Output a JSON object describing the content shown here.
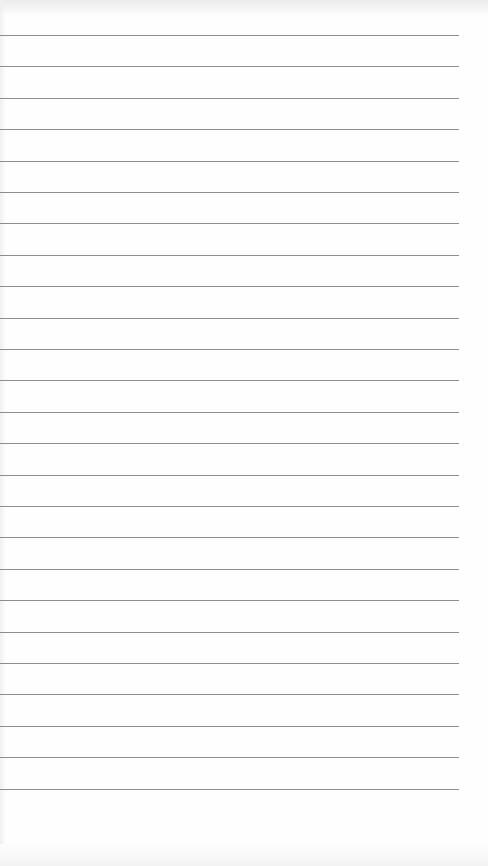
{
  "page": {
    "type": "lined-notepad",
    "line_count": 25,
    "first_line_y": 35,
    "line_spacing": 31.4,
    "line_width": 459,
    "line_color": "#8e8e8e",
    "paper_color": "#fefefe",
    "text_lines": []
  }
}
